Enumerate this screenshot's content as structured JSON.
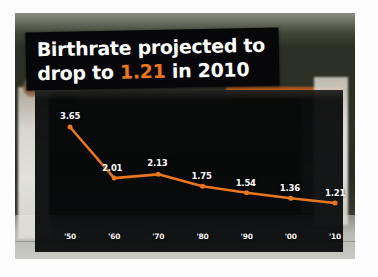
{
  "title": {
    "line1": "Birthrate projected to",
    "line2_pre": "drop to ",
    "line2_value": "1.21",
    "line2_post": " in 2010"
  },
  "colors": {
    "line": "#e8761f",
    "highlight": "#e8761f",
    "panel": "#05060 8",
    "label": "#ffffff"
  },
  "chart_data": {
    "type": "line",
    "title": "Birthrate projected to drop to 1.21 in 2010",
    "xlabel": "",
    "ylabel": "",
    "categories": [
      "'50",
      "'60",
      "'70",
      "'80",
      "'90",
      "'00",
      "'10"
    ],
    "values": [
      3.65,
      2.01,
      2.13,
      1.75,
      1.54,
      1.36,
      1.21
    ],
    "point_labels": [
      "3.65",
      "2.01",
      "2.13",
      "1.75",
      "1.54",
      "1.36",
      "1.21"
    ],
    "ylim": [
      0,
      4
    ],
    "grid": false,
    "legend": false,
    "series": [
      {
        "name": "Birthrate",
        "values": [
          3.65,
          2.01,
          2.13,
          1.75,
          1.54,
          1.36,
          1.21
        ],
        "color": "#e8761f"
      }
    ]
  }
}
